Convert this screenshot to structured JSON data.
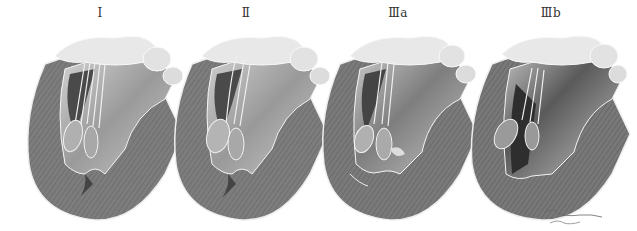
{
  "figure": {
    "panels": [
      {
        "label": "Ⅰ",
        "x": 100,
        "left": 15
      },
      {
        "label": "Ⅱ",
        "x": 246,
        "left": 160
      },
      {
        "label": "Ⅲa",
        "x": 398,
        "left": 310
      },
      {
        "label": "Ⅲb",
        "x": 551,
        "left": 462
      }
    ],
    "colors": {
      "wall": "#7a7a7a",
      "wall_dark": "#5e5e5e",
      "cavity": "#b8b8b8",
      "cavity_dark": "#3a3a3a",
      "valve": "#e6e6e6",
      "outline": "#f2f2f2",
      "label": "#333333"
    }
  }
}
